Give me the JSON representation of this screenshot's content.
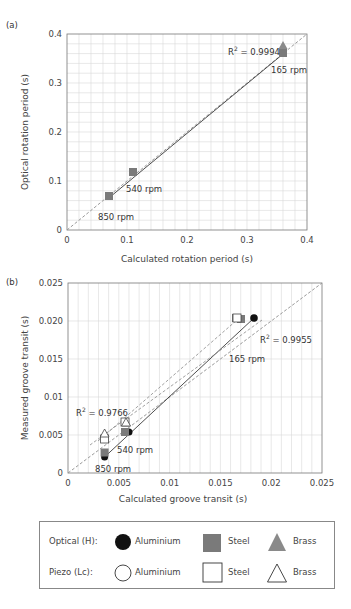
{
  "chart_data": [
    {
      "panel": "(a)",
      "type": "scatter",
      "xlabel": "Calculated rotation period (s)",
      "ylabel": "Optical rotation period (s)",
      "xlim": [
        0,
        0.4
      ],
      "ylim": [
        0,
        0.4
      ],
      "xticks": [
        "0",
        "0.1",
        "0.2",
        "0.3",
        "0.4"
      ],
      "yticks": [
        "0",
        "0.1",
        "0.2",
        "0.3",
        "0.4"
      ],
      "grid": true,
      "reference_line": "y = x (dashed)",
      "fit": {
        "r2_label": "R² = 0.9994",
        "from": [
          0.07,
          0.068
        ],
        "to": [
          0.36,
          0.36
        ]
      },
      "annotations": [
        "165 rpm",
        "540 rpm",
        "850 rpm"
      ],
      "series": [
        {
          "name": "Optical (H) Steel",
          "marker": "square-filled",
          "points": [
            [
              0.072,
              0.068
            ],
            [
              0.111,
              0.107
            ],
            [
              0.36,
              0.362
            ]
          ]
        },
        {
          "name": "Optical (H) Brass",
          "marker": "triangle-filled",
          "points": [
            [
              0.36,
              0.368
            ]
          ]
        }
      ]
    },
    {
      "panel": "(b)",
      "type": "scatter",
      "xlabel": "Calculated groove transit (s)",
      "ylabel": "Measured groove transit (s)",
      "xlim": [
        0,
        0.025
      ],
      "ylim": [
        0,
        0.025
      ],
      "xticks": [
        "0",
        "0.005",
        "0.01",
        "0.015",
        "0.02",
        "0.025"
      ],
      "yticks": [
        "0",
        "0.005",
        "0.01",
        "0.015",
        "0.020",
        "0.025"
      ],
      "grid": true,
      "reference_line": "y = x (dashed)",
      "fits": [
        {
          "r2_label": "R² = 0.9955",
          "from": [
            0.0036,
            0.0024
          ],
          "to": [
            0.0183,
            0.0204
          ]
        },
        {
          "r2_label": "R² = 0.9766",
          "from": [
            0.0036,
            0.0044
          ],
          "to": [
            0.0165,
            0.0201
          ]
        }
      ],
      "annotations": [
        "165 rpm",
        "540 rpm",
        "850 rpm"
      ],
      "series": [
        {
          "name": "Optical (H) Aluminium",
          "marker": "circle-filled",
          "points": [
            [
              0.0036,
              0.0021
            ],
            [
              0.006,
              0.0054
            ],
            [
              0.0183,
              0.0204
            ]
          ]
        },
        {
          "name": "Optical (H) Steel",
          "marker": "square-filled",
          "points": [
            [
              0.0036,
              0.0027
            ],
            [
              0.0056,
              0.0054
            ],
            [
              0.0165,
              0.0172
            ],
            [
              0.017,
              0.0171
            ]
          ]
        },
        {
          "name": "Piezo (Lc) Steel",
          "marker": "square-open",
          "points": [
            [
              0.0036,
              0.0044
            ],
            [
              0.0056,
              0.0066
            ],
            [
              0.0165,
              0.0201
            ]
          ]
        },
        {
          "name": "Piezo (Lc) Brass",
          "marker": "triangle-open",
          "points": [
            [
              0.0036,
              0.005
            ],
            [
              0.0057,
              0.0066
            ]
          ]
        }
      ]
    }
  ],
  "figure": {
    "a": {
      "panel_label": "(a)",
      "xlabel": "Calculated rotation period (s)",
      "ylabel": "Optical rotation period (s)",
      "r2": "R",
      "r2_value": " = 0.9994",
      "rpm165": "165 rpm",
      "rpm540": "540 rpm",
      "rpm850": "850 rpm",
      "xticks": [
        "0",
        "0.1",
        "0.2",
        "0.3",
        "0.4"
      ],
      "yticks": [
        "0",
        "0.1",
        "0.2",
        "0.3",
        "0.4"
      ]
    },
    "b": {
      "panel_label": "(b)",
      "xlabel": "Calculated groove transit (s)",
      "ylabel": "Measured groove transit (s)",
      "r2_value_a": " = 0.9955",
      "r2_value_b": " = 0.9766",
      "r2": "R",
      "rpm165": "165 rpm",
      "rpm540": "540 rpm",
      "rpm850": "850 rpm",
      "xticks": [
        "0",
        "0.005",
        "0.01",
        "0.015",
        "0.02",
        "0.025"
      ],
      "yticks": [
        "0",
        "0.005",
        "0.01",
        "0.015",
        "0.020",
        "0.025"
      ]
    }
  },
  "legend": {
    "rows": [
      {
        "label": "Optical (H):",
        "items": [
          "Aluminium",
          "Steel",
          "Brass"
        ]
      },
      {
        "label": "Piezo (Lc):",
        "items": [
          "Aluminium",
          "Steel",
          "Brass"
        ]
      }
    ]
  },
  "colors": {
    "filled_grey": "#7a7a7a",
    "filled_black": "#111111",
    "grid": "#d8d8d8"
  }
}
